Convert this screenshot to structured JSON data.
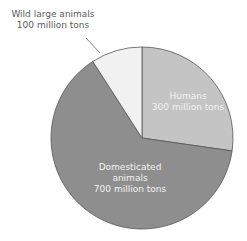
{
  "chart_data": {
    "type": "pie",
    "title": "",
    "slices": [
      {
        "label": "Humans",
        "value": 300,
        "unit": "million tons",
        "color": "#c4c4c4"
      },
      {
        "label": "Domesticated animals",
        "value": 700,
        "unit": "million tons",
        "color": "#8e8e8e"
      },
      {
        "label": "Wild large animals",
        "value": 100,
        "unit": "million tons",
        "color": "#f1f1f1"
      }
    ],
    "legend": "none",
    "start_angle": "12 o'clock, clockwise"
  },
  "labels": {
    "wild_line1": "Wild large animals",
    "wild_line2": "100 million tons",
    "humans_line1": "Humans",
    "humans_line2": "300 million tons",
    "dom_line1": "Domesticated",
    "dom_line2": "animals",
    "dom_line3": "700 million tons"
  }
}
